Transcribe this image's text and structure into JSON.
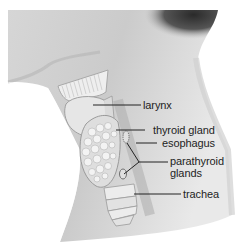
{
  "diagram": {
    "labels": [
      {
        "id": "larynx",
        "text": "larynx"
      },
      {
        "id": "thyroid-gland",
        "text": "thyroid gland"
      },
      {
        "id": "esophagus",
        "text": "esophagus"
      },
      {
        "id": "parathyroid-glands-line1",
        "text": "parathyroid"
      },
      {
        "id": "parathyroid-glands-line2",
        "text": "glands"
      },
      {
        "id": "trachea",
        "text": "trachea"
      }
    ],
    "colors": {
      "background": "#ffffff",
      "skin_light": "#e4e4e4",
      "skin_mid": "#bdbdbd",
      "hair_dark": "#3a3a3a",
      "leader_line": "#222222",
      "label_text": "#1e1e1e"
    }
  }
}
